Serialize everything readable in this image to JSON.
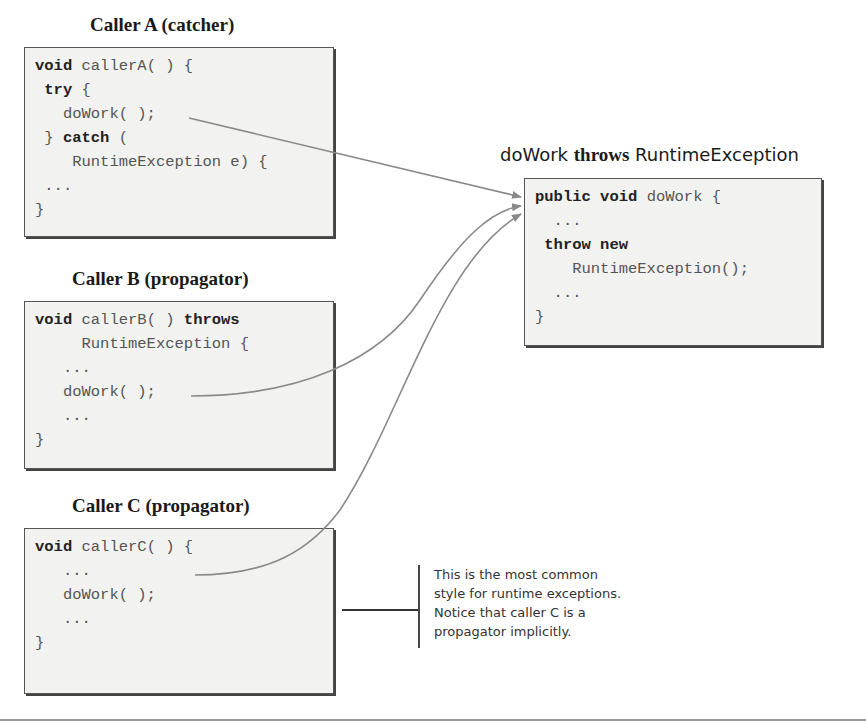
{
  "caller_a": {
    "title": "Caller A (catcher)",
    "lines": [
      [
        {
          "t": "void",
          "kw": true
        },
        {
          "t": " callerA( ) {",
          "kw": false
        }
      ],
      [
        {
          "t": " ",
          "kw": false
        },
        {
          "t": "try",
          "kw": true
        },
        {
          "t": " {",
          "kw": false
        }
      ],
      [
        {
          "t": "   doWork( );",
          "kw": false
        }
      ],
      [
        {
          "t": " } ",
          "kw": false
        },
        {
          "t": "catch",
          "kw": true
        },
        {
          "t": " (",
          "kw": false
        }
      ],
      [
        {
          "t": "    RuntimeException e) {",
          "kw": false
        }
      ],
      [
        {
          "t": " ...",
          "kw": false
        }
      ],
      [
        {
          "t": "}",
          "kw": false
        }
      ]
    ]
  },
  "caller_b": {
    "title": "Caller B (propagator)",
    "lines": [
      [
        {
          "t": "void",
          "kw": true
        },
        {
          "t": " callerB( ) ",
          "kw": false
        },
        {
          "t": "throws",
          "kw": true
        }
      ],
      [
        {
          "t": "     RuntimeException {",
          "kw": false
        }
      ],
      [
        {
          "t": "   ...",
          "kw": false
        }
      ],
      [
        {
          "t": "   doWork( );",
          "kw": false
        }
      ],
      [
        {
          "t": "   ...",
          "kw": false
        }
      ],
      [
        {
          "t": "}",
          "kw": false
        }
      ]
    ]
  },
  "caller_c": {
    "title": "Caller C (propagator)",
    "lines": [
      [
        {
          "t": "void",
          "kw": true
        },
        {
          "t": " callerC( ) {",
          "kw": false
        }
      ],
      [
        {
          "t": "   ...",
          "kw": false
        }
      ],
      [
        {
          "t": "   doWork( );",
          "kw": false
        }
      ],
      [
        {
          "t": "   ...",
          "kw": false
        }
      ],
      [
        {
          "t": "}",
          "kw": false
        }
      ]
    ]
  },
  "do_work": {
    "title_part1": "doWork",
    "title_part2": "throws",
    "title_part3": "RuntimeException",
    "lines": [
      [
        {
          "t": "public void",
          "kw": true
        },
        {
          "t": " doWork {",
          "kw": false
        }
      ],
      [
        {
          "t": "  ...",
          "kw": false
        }
      ],
      [
        {
          "t": " ",
          "kw": false
        },
        {
          "t": "throw new",
          "kw": true
        }
      ],
      [
        {
          "t": "    RuntimeException();",
          "kw": false
        }
      ],
      [
        {
          "t": "  ...",
          "kw": false
        }
      ],
      [
        {
          "t": "}",
          "kw": false
        }
      ]
    ]
  },
  "note": {
    "lines": [
      "This is the most common",
      "style for runtime exceptions.",
      "Notice that caller C is a",
      "propagator implicitly."
    ]
  },
  "colors": {
    "arrow": "#8a8a8a",
    "box_bg": "#f2f2f0",
    "box_border": "#555555"
  }
}
